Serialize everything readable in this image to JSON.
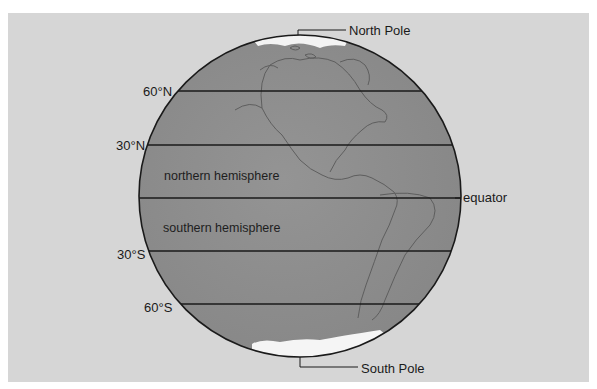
{
  "diagram": {
    "title": "",
    "labels": {
      "north_pole": "North Pole",
      "south_pole": "South Pole",
      "equator": "equator",
      "lat_60n": "60°N",
      "lat_30n": "30°N",
      "lat_30s": "30°S",
      "lat_60s": "60°S",
      "northern_hemisphere": "northern hemisphere",
      "southern_hemisphere": "southern hemisphere"
    },
    "latitude_lines": [
      {
        "label": "60°N",
        "y": 91
      },
      {
        "label": "30°N",
        "y": 145
      },
      {
        "label": "equator",
        "y": 198
      },
      {
        "label": "30°S",
        "y": 251
      },
      {
        "label": "60°S",
        "y": 304
      }
    ],
    "colors": {
      "background_panel": "#d6d6d6",
      "globe_fill": "#8f8f8f",
      "ice": "#f4f4f4",
      "outline": "#1a1a1a"
    }
  }
}
